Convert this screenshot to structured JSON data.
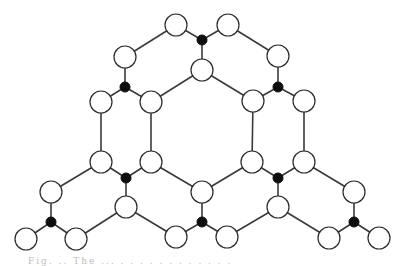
{
  "diagram": {
    "style": {
      "edge_color": "#3a3a3a",
      "white_node_fill": "#ffffff",
      "white_node_stroke": "#2a2a2a",
      "black_node_fill": "#0d0d0d",
      "white_node_radius": 11,
      "black_node_radius": 5
    },
    "nodes": [
      {
        "id": "w1",
        "type": "white",
        "x": 176,
        "y": 25
      },
      {
        "id": "b1",
        "type": "black",
        "x": 202,
        "y": 40
      },
      {
        "id": "w2",
        "type": "white",
        "x": 228,
        "y": 25
      },
      {
        "id": "w3",
        "type": "white",
        "x": 202,
        "y": 70
      },
      {
        "id": "w4",
        "type": "white",
        "x": 125,
        "y": 57
      },
      {
        "id": "b2",
        "type": "black",
        "x": 125,
        "y": 87
      },
      {
        "id": "w5",
        "type": "white",
        "x": 101,
        "y": 102
      },
      {
        "id": "w6",
        "type": "white",
        "x": 151,
        "y": 102
      },
      {
        "id": "w7",
        "type": "white",
        "x": 278,
        "y": 56
      },
      {
        "id": "b3",
        "type": "black",
        "x": 278,
        "y": 87
      },
      {
        "id": "w8",
        "type": "white",
        "x": 253,
        "y": 101
      },
      {
        "id": "w9",
        "type": "white",
        "x": 304,
        "y": 101
      },
      {
        "id": "w10",
        "type": "white",
        "x": 101,
        "y": 162
      },
      {
        "id": "w11",
        "type": "white",
        "x": 151,
        "y": 162
      },
      {
        "id": "b4",
        "type": "black",
        "x": 126,
        "y": 178
      },
      {
        "id": "w12",
        "type": "white",
        "x": 126,
        "y": 207
      },
      {
        "id": "w13",
        "type": "white",
        "x": 252,
        "y": 162
      },
      {
        "id": "w14",
        "type": "white",
        "x": 304,
        "y": 162
      },
      {
        "id": "b5",
        "type": "black",
        "x": 278,
        "y": 178
      },
      {
        "id": "w15",
        "type": "white",
        "x": 278,
        "y": 207
      },
      {
        "id": "w16",
        "type": "white",
        "x": 202,
        "y": 192
      },
      {
        "id": "b6",
        "type": "black",
        "x": 202,
        "y": 222
      },
      {
        "id": "w17",
        "type": "white",
        "x": 176,
        "y": 237
      },
      {
        "id": "w18",
        "type": "white",
        "x": 227,
        "y": 237
      },
      {
        "id": "w19",
        "type": "white",
        "x": 51,
        "y": 192
      },
      {
        "id": "b7",
        "type": "black",
        "x": 51,
        "y": 222
      },
      {
        "id": "w20",
        "type": "white",
        "x": 26,
        "y": 239
      },
      {
        "id": "w21",
        "type": "white",
        "x": 76,
        "y": 239
      },
      {
        "id": "w22",
        "type": "white",
        "x": 354,
        "y": 192
      },
      {
        "id": "b8",
        "type": "black",
        "x": 354,
        "y": 222
      },
      {
        "id": "w23",
        "type": "white",
        "x": 329,
        "y": 238
      },
      {
        "id": "w24",
        "type": "white",
        "x": 379,
        "y": 238
      }
    ],
    "edges": [
      [
        "w1",
        "b1"
      ],
      [
        "b1",
        "w2"
      ],
      [
        "b1",
        "w3"
      ],
      [
        "w1",
        "w4"
      ],
      [
        "w2",
        "w7"
      ],
      [
        "w4",
        "b2"
      ],
      [
        "b2",
        "w5"
      ],
      [
        "b2",
        "w6"
      ],
      [
        "w7",
        "b3"
      ],
      [
        "b3",
        "w8"
      ],
      [
        "b3",
        "w9"
      ],
      [
        "w3",
        "w6"
      ],
      [
        "w3",
        "w8"
      ],
      [
        "w5",
        "w10"
      ],
      [
        "w6",
        "w11"
      ],
      [
        "w8",
        "w13"
      ],
      [
        "w9",
        "w14"
      ],
      [
        "w10",
        "b4"
      ],
      [
        "b4",
        "w11"
      ],
      [
        "b4",
        "w12"
      ],
      [
        "w13",
        "b5"
      ],
      [
        "b5",
        "w14"
      ],
      [
        "b5",
        "w15"
      ],
      [
        "w11",
        "w16"
      ],
      [
        "w13",
        "w16"
      ],
      [
        "w10",
        "w19"
      ],
      [
        "w14",
        "w22"
      ],
      [
        "w16",
        "b6"
      ],
      [
        "b6",
        "w17"
      ],
      [
        "b6",
        "w18"
      ],
      [
        "w12",
        "w21"
      ],
      [
        "w12",
        "w17"
      ],
      [
        "w15",
        "w18"
      ],
      [
        "w15",
        "w23"
      ],
      [
        "w19",
        "b7"
      ],
      [
        "b7",
        "w20"
      ],
      [
        "b7",
        "w21"
      ],
      [
        "w22",
        "b8"
      ],
      [
        "b8",
        "w23"
      ],
      [
        "b8",
        "w24"
      ]
    ]
  },
  "caption": {
    "text": "Fig. ..  The ... . . . . . . . . . . . ."
  }
}
